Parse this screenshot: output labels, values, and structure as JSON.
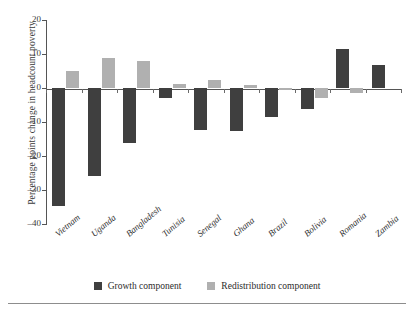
{
  "chart_data": {
    "type": "bar",
    "title": "",
    "subtitle": "",
    "xlabel": "",
    "ylabel": "Percentage points change in headcount poverty",
    "ylim": [
      -40,
      20
    ],
    "yticks": [
      20,
      10,
      0,
      -10,
      -20,
      -30,
      -40
    ],
    "ytick_labels": [
      "20",
      "10",
      "0",
      "–10",
      "–20",
      "–30",
      "–40"
    ],
    "grid": false,
    "legend_position": "bottom",
    "categories": [
      "Vietnam",
      "Uganda",
      "Bangladesh",
      "Tunisia",
      "Senegal",
      "Ghana",
      "Brazil",
      "Bolivia",
      "Romania",
      "Zambia"
    ],
    "series": [
      {
        "name": "Growth component",
        "color": "#3f3f3f",
        "values": [
          -34.6,
          -25.9,
          -16.1,
          -3.0,
          -12.3,
          -12.6,
          -8.5,
          -6.2,
          11.6,
          6.8
        ]
      },
      {
        "name": "Redistribution component",
        "color": "#b0b0b0",
        "values": [
          5.1,
          8.7,
          7.9,
          1.3,
          2.5,
          1.0,
          -0.5,
          -3.0,
          -1.5,
          0.0
        ]
      }
    ]
  },
  "legend": {
    "items": [
      {
        "label": "Growth component",
        "color": "#3f3f3f"
      },
      {
        "label": "Redistribution component",
        "color": "#b0b0b0"
      }
    ]
  }
}
